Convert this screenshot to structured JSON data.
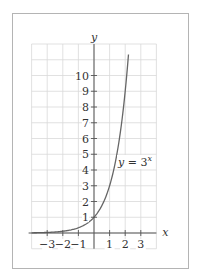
{
  "chart_data": {
    "type": "line",
    "title": "",
    "xlabel": "x",
    "ylabel": "y",
    "xlim": [
      -4,
      4
    ],
    "ylim": [
      -1,
      12
    ],
    "grid": true,
    "x_ticks": [
      -3,
      -2,
      -1,
      1,
      2,
      3
    ],
    "x_tick_labels": [
      "−3",
      "−2",
      "−1",
      "1",
      "2",
      "3"
    ],
    "y_ticks": [
      1,
      2,
      3,
      4,
      5,
      6,
      7,
      8,
      9,
      10
    ],
    "y_tick_labels": [
      "1",
      "2",
      "3",
      "4",
      "5",
      "6",
      "7",
      "8",
      "9",
      "10"
    ],
    "series": [
      {
        "name": "y = 3^x",
        "function": "3^x",
        "x_range": [
          -4,
          2.21
        ],
        "x": [
          -4,
          -3,
          -2,
          -1,
          0,
          1,
          2,
          2.21
        ],
        "y": [
          0.012,
          0.037,
          0.111,
          0.333,
          1,
          3,
          9,
          11.3
        ],
        "color": "#666666"
      }
    ],
    "annotations": [
      {
        "text_base": "y = 3",
        "text_sup": "x",
        "at": [
          1.6,
          4.3
        ]
      }
    ]
  }
}
